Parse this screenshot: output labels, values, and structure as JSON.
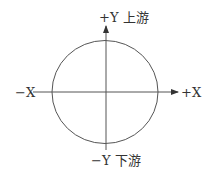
{
  "diagram": {
    "type": "coordinate-axes-with-circle",
    "labels": {
      "pos_y": "+Y 上游",
      "neg_y": "−Y 下游",
      "neg_x": "−X",
      "pos_x": "+X"
    },
    "colors": {
      "stroke": "#555555",
      "text": "#333333",
      "background": "#ffffff"
    }
  }
}
